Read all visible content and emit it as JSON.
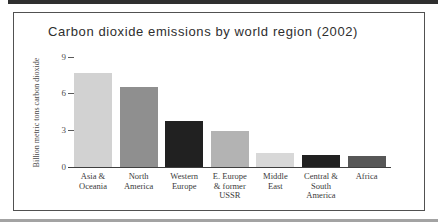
{
  "figure": {
    "title": "Carbon dioxide emissions by world region (2002)"
  },
  "chart_data": {
    "type": "bar",
    "title": "Carbon dioxide emissions by world region (2002)",
    "xlabel": "",
    "ylabel": "Billion metric tons carbon dioxide",
    "categories": [
      "Asia & Oceania",
      "North America",
      "Western Europe",
      "E. Europe & former USSR",
      "Middle East",
      "Central & South America",
      "Africa"
    ],
    "category_lines": [
      [
        "Asia &",
        "Oceania"
      ],
      [
        "North",
        "America"
      ],
      [
        "Western",
        "Europe"
      ],
      [
        "E. Europe",
        "& former",
        "USSR"
      ],
      [
        "Middle",
        "East"
      ],
      [
        "Central &",
        "South",
        "America"
      ],
      [
        "Africa"
      ]
    ],
    "values": [
      7.7,
      6.6,
      3.8,
      3.0,
      1.2,
      1.0,
      0.9
    ],
    "bar_colors": [
      "#d2d2d2",
      "#8f8f8f",
      "#212121",
      "#b3b3b3",
      "#d8d8d8",
      "#212121",
      "#575757"
    ],
    "yticks": [
      0,
      3,
      6,
      9
    ],
    "ylim": [
      0,
      9.5
    ],
    "grid": false,
    "legend": false
  }
}
